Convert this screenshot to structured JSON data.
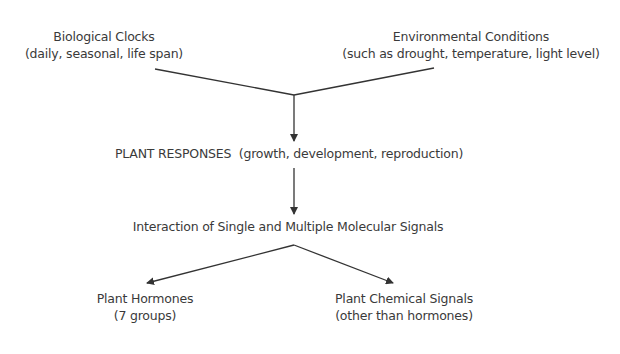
{
  "diagram": {
    "nodes": {
      "biological_clocks": {
        "title": "Biological Clocks",
        "subtitle": "(daily, seasonal, life span)"
      },
      "environmental_conditions": {
        "title": "Environmental Conditions",
        "subtitle": "(such as drought, temperature, light level)"
      },
      "plant_responses": {
        "title": "PLANT RESPONSES  (growth, development, reproduction)"
      },
      "molecular_signals": {
        "title": "Interaction of Single and Multiple Molecular Signals"
      },
      "plant_hormones": {
        "title": "Plant Hormones",
        "subtitle": "(7 groups)"
      },
      "chemical_signals": {
        "title": "Plant Chemical Signals",
        "subtitle": "(other than hormones)"
      }
    },
    "edges": [
      {
        "from": "biological_clocks",
        "to": "plant_responses"
      },
      {
        "from": "environmental_conditions",
        "to": "plant_responses"
      },
      {
        "from": "plant_responses",
        "to": "molecular_signals"
      },
      {
        "from": "molecular_signals",
        "to": "plant_hormones"
      },
      {
        "from": "molecular_signals",
        "to": "chemical_signals"
      }
    ],
    "line_color": "#333333",
    "text_color": "#3a3a3a"
  }
}
